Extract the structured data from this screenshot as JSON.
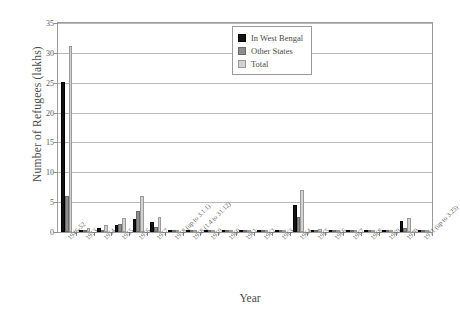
{
  "chart_data": {
    "type": "bar",
    "title": "",
    "xlabel": "Year",
    "ylabel": "Number of Refugees (lakhs)",
    "ylim": [
      0,
      35
    ],
    "ytick_step": 5,
    "yticks": [
      "0",
      "5",
      "10",
      "15",
      "20",
      "25",
      "30",
      "35"
    ],
    "grid": true,
    "legend_position": "top-right",
    "categories": [
      "1946-52",
      "1953",
      "1954",
      "1955",
      "1956",
      "1957",
      "1958 (up to 3.1.1)",
      "1958 (1.4 to 31.12)",
      "1959",
      "1960",
      "1961",
      "1962",
      "1963",
      "1964",
      "1965",
      "1966",
      "1967",
      "1968",
      "1969",
      "1970",
      "1971 (up to 3.25)"
    ],
    "series": [
      {
        "name": "In West Bengal",
        "color": "#131313",
        "values": [
          25.2,
          0.35,
          0.7,
          1.1,
          2.2,
          1.6,
          0.05,
          0.05,
          0.1,
          0.12,
          0.1,
          0.15,
          0.2,
          4.5,
          0.3,
          0.1,
          0.12,
          0.1,
          0.1,
          1.8,
          0.1
        ]
      },
      {
        "name": "Other States",
        "color": "#8e8e8e",
        "values": [
          6.0,
          0.3,
          0.4,
          1.3,
          3.5,
          0.9,
          0.03,
          0.03,
          0.06,
          0.08,
          0.07,
          0.1,
          0.12,
          2.5,
          0.2,
          0.08,
          0.08,
          0.06,
          0.06,
          0.6,
          0.05
        ]
      },
      {
        "name": "Total",
        "color": "#d2d2d2",
        "values": [
          31.1,
          0.65,
          1.1,
          2.4,
          6.0,
          2.5,
          0.08,
          0.08,
          0.16,
          0.2,
          0.17,
          0.25,
          0.32,
          7.0,
          0.5,
          0.18,
          0.2,
          0.16,
          0.16,
          2.4,
          0.15
        ]
      }
    ]
  },
  "legend": {
    "items": [
      {
        "label": "In West Bengal"
      },
      {
        "label": "Other States"
      },
      {
        "label": "Total"
      }
    ]
  }
}
